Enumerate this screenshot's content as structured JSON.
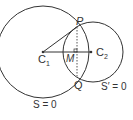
{
  "diagram": {
    "labels": {
      "P": "P",
      "Q": "Q",
      "M": "M",
      "C1": "C",
      "C1_sub": "1",
      "C2": "C",
      "C2_sub": "2",
      "S": "S = 0",
      "S_prime": "S′ = 0"
    },
    "colors": {
      "stroke": "#333333",
      "background": "#ffffff"
    }
  }
}
